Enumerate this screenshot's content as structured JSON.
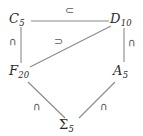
{
  "diagram": {
    "type": "subgroup-lattice",
    "canvas": {
      "width": 143,
      "height": 136,
      "background": "#ffffff"
    },
    "stroke_color": "#8a8a8a",
    "text_color": "#2b2b2b",
    "edge_label_color": "#5a5a5a",
    "nodes": [
      {
        "id": "c5",
        "base": "C",
        "subscript": "5",
        "label": "C5",
        "x": 18,
        "y": 19
      },
      {
        "id": "d10",
        "base": "D",
        "subscript": "10",
        "label": "D10",
        "x": 119,
        "y": 19
      },
      {
        "id": "f20",
        "base": "F",
        "subscript": "20",
        "label": "F20",
        "x": 18,
        "y": 71
      },
      {
        "id": "a5",
        "base": "A",
        "subscript": "5",
        "label": "A5",
        "x": 120,
        "y": 71
      },
      {
        "id": "sigma5",
        "base": "Σ",
        "subscript": "5",
        "label": "Σ5",
        "x": 70,
        "y": 125
      }
    ],
    "edges": [
      {
        "id": "c5-d10",
        "from": "c5",
        "to": "d10",
        "label": "⊂",
        "label_name": "subset-symbol"
      },
      {
        "id": "c5-f20",
        "from": "c5",
        "to": "f20",
        "label": "∩",
        "label_name": "intersection-symbol"
      },
      {
        "id": "f20-d10",
        "from": "f20",
        "to": "d10",
        "label": "⊃",
        "label_name": "superset-symbol"
      },
      {
        "id": "d10-a5",
        "from": "d10",
        "to": "a5",
        "label": "∩",
        "label_name": "intersection-symbol"
      },
      {
        "id": "f20-sigma5",
        "from": "f20",
        "to": "sigma5",
        "label": "∩",
        "label_name": "intersection-symbol"
      },
      {
        "id": "a5-sigma5",
        "from": "a5",
        "to": "sigma5",
        "label": "∩",
        "label_name": "intersection-symbol"
      }
    ]
  }
}
